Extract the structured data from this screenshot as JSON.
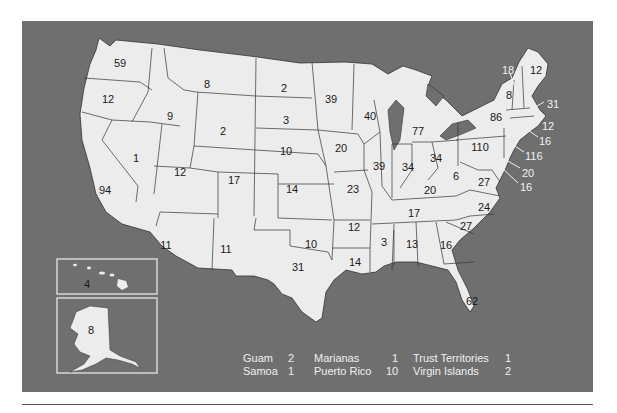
{
  "map": {
    "title": "",
    "background": "#6f6f6f",
    "land_color": "#ececec",
    "states": [
      {
        "id": "WA",
        "value": "59",
        "x": 120,
        "y": 63
      },
      {
        "id": "OR",
        "value": "12",
        "x": 108,
        "y": 99
      },
      {
        "id": "ID",
        "value": "9",
        "x": 170,
        "y": 116
      },
      {
        "id": "MT",
        "value": "8",
        "x": 207,
        "y": 84
      },
      {
        "id": "WY",
        "value": "2",
        "x": 223,
        "y": 131
      },
      {
        "id": "ND",
        "value": "2",
        "x": 284,
        "y": 88
      },
      {
        "id": "SD",
        "value": "3",
        "x": 286,
        "y": 120
      },
      {
        "id": "NE",
        "value": "10",
        "x": 286,
        "y": 151
      },
      {
        "id": "KS",
        "value": "14",
        "x": 292,
        "y": 189
      },
      {
        "id": "OK",
        "value": "10",
        "x": 311,
        "y": 244
      },
      {
        "id": "TX",
        "value": "31",
        "x": 298,
        "y": 267
      },
      {
        "id": "NV",
        "value": "1",
        "x": 136,
        "y": 158
      },
      {
        "id": "CA",
        "value": "94",
        "x": 105,
        "y": 190
      },
      {
        "id": "UT",
        "value": "12",
        "x": 180,
        "y": 172
      },
      {
        "id": "CO",
        "value": "17",
        "x": 234,
        "y": 180
      },
      {
        "id": "AZ",
        "value": "11",
        "x": 166,
        "y": 245
      },
      {
        "id": "NM",
        "value": "11",
        "x": 226,
        "y": 249
      },
      {
        "id": "MN",
        "value": "39",
        "x": 331,
        "y": 99
      },
      {
        "id": "WI",
        "value": "40",
        "x": 370,
        "y": 116
      },
      {
        "id": "IA",
        "value": "20",
        "x": 341,
        "y": 148
      },
      {
        "id": "MO",
        "value": "23",
        "x": 353,
        "y": 189
      },
      {
        "id": "AR",
        "value": "12",
        "x": 354,
        "y": 227
      },
      {
        "id": "LA",
        "value": "14",
        "x": 355,
        "y": 262
      },
      {
        "id": "IL",
        "value": "39",
        "x": 379,
        "y": 166
      },
      {
        "id": "MI",
        "value": "77",
        "x": 418,
        "y": 131
      },
      {
        "id": "IN",
        "value": "34",
        "x": 408,
        "y": 167
      },
      {
        "id": "OH",
        "value": "34",
        "x": 436,
        "y": 158
      },
      {
        "id": "KY",
        "value": "20",
        "x": 430,
        "y": 190
      },
      {
        "id": "TN",
        "value": "17",
        "x": 414,
        "y": 213
      },
      {
        "id": "MS",
        "value": "3",
        "x": 384,
        "y": 242
      },
      {
        "id": "AL",
        "value": "13",
        "x": 412,
        "y": 244
      },
      {
        "id": "GA",
        "value": "16",
        "x": 446,
        "y": 245
      },
      {
        "id": "FL",
        "value": "62",
        "x": 472,
        "y": 301
      },
      {
        "id": "SC",
        "value": "27",
        "x": 466,
        "y": 226
      },
      {
        "id": "NC",
        "value": "24",
        "x": 484,
        "y": 207
      },
      {
        "id": "VA",
        "value": "27",
        "x": 484,
        "y": 182
      },
      {
        "id": "WV",
        "value": "6",
        "x": 456,
        "y": 176
      },
      {
        "id": "PA",
        "value": "110",
        "x": 480,
        "y": 147
      },
      {
        "id": "NY",
        "value": "86",
        "x": 496,
        "y": 117
      },
      {
        "id": "VT",
        "value": "8",
        "x": 509,
        "y": 95
      },
      {
        "id": "ME",
        "value": "12",
        "x": 536,
        "y": 70
      },
      {
        "id": "HI",
        "value": "4",
        "x": 87,
        "y": 284
      },
      {
        "id": "AK",
        "value": "8",
        "x": 91,
        "y": 330
      }
    ],
    "callouts": [
      {
        "id": "NH",
        "value": "18",
        "x": 502,
        "y": 70
      },
      {
        "id": "MA",
        "value": "31",
        "x": 547,
        "y": 104
      },
      {
        "id": "RI",
        "value": "12",
        "x": 542,
        "y": 126
      },
      {
        "id": "CT",
        "value": "16",
        "x": 539,
        "y": 141
      },
      {
        "id": "NJ",
        "value": "116",
        "x": 525,
        "y": 156
      },
      {
        "id": "DE",
        "value": "20",
        "x": 522,
        "y": 173
      },
      {
        "id": "MD",
        "value": "16",
        "x": 520,
        "y": 187
      }
    ]
  },
  "legend": {
    "rows": [
      [
        {
          "name": "Guam",
          "value": "2"
        },
        {
          "name": "Marianas",
          "value": "1"
        },
        {
          "name": "Trust Territories",
          "value": "1"
        }
      ],
      [
        {
          "name": "Samoa",
          "value": "1"
        },
        {
          "name": "Puerto Rico",
          "value": "10"
        },
        {
          "name": "Virgin Islands",
          "value": "2"
        }
      ]
    ]
  }
}
